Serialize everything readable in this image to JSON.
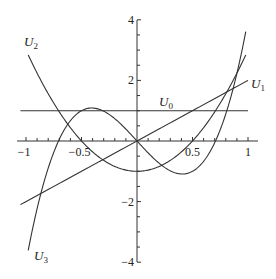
{
  "chart_data": {
    "type": "line",
    "title": "",
    "xlabel": "",
    "ylabel": "",
    "xlim": [
      -1.05,
      1.05
    ],
    "ylim": [
      -4,
      4
    ],
    "grid": false,
    "legend": "none (inline curve labels)",
    "x_ticks": [
      -1,
      -0.5,
      0.5,
      1
    ],
    "x_tick_labels": [
      "−1",
      "−0.5",
      "0.5",
      "1"
    ],
    "y_ticks": [
      -4,
      -2,
      2,
      4
    ],
    "y_tick_labels": [
      "−4",
      "−2",
      "2",
      "4"
    ],
    "series": [
      {
        "name": "U0",
        "label_main": "U",
        "label_sub": "0",
        "formula": "1",
        "x_range": [
          -1.05,
          1.0
        ]
      },
      {
        "name": "U1",
        "label_main": "U",
        "label_sub": "1",
        "formula": "2x",
        "x_range": [
          -1.05,
          1.0
        ]
      },
      {
        "name": "U2",
        "label_main": "U",
        "label_sub": "2",
        "formula": "4x^2-1",
        "x_range": [
          -0.98,
          0.98
        ]
      },
      {
        "name": "U3",
        "label_main": "U",
        "label_sub": "3",
        "formula": "8x^3-4x",
        "x_range": [
          -0.98,
          0.98
        ]
      }
    ],
    "sample_points": {
      "x": [
        -1,
        -0.75,
        -0.5,
        -0.25,
        0,
        0.25,
        0.5,
        0.75,
        1
      ],
      "U0": [
        1,
        1,
        1,
        1,
        1,
        1,
        1,
        1,
        1
      ],
      "U1": [
        -2,
        -1.5,
        -1,
        -0.5,
        0,
        0.5,
        1,
        1.5,
        2
      ],
      "U2": [
        3,
        1.25,
        0,
        -0.75,
        -1,
        -0.75,
        0,
        1.25,
        3
      ],
      "U3": [
        -4,
        -0.375,
        1,
        0.875,
        0,
        -0.875,
        -1,
        0.375,
        4
      ]
    }
  }
}
